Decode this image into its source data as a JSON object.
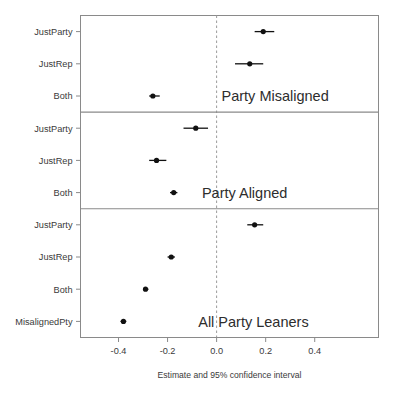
{
  "chart_data": {
    "type": "scatter",
    "title": "",
    "xlabel": "Estimate and 95% confidence interval",
    "ylabel": "",
    "xlim": [
      -0.555,
      0.66
    ],
    "xticks": [
      -0.4,
      -0.2,
      0.0,
      0.2,
      0.4
    ],
    "xticklabels": [
      "-0.4",
      "-0.2",
      "0.0",
      "0.2",
      "0.4"
    ],
    "grid": false,
    "legend": "none",
    "reference_line": 0.0,
    "orientation": "horizontal",
    "panels": [
      {
        "label": "Party Misaligned",
        "label_x": 0.02,
        "rows": [
          {
            "label": "JustParty",
            "estimate": 0.19,
            "ci_low": 0.155,
            "ci_high": 0.235
          },
          {
            "label": "JustRep",
            "estimate": 0.135,
            "ci_low": 0.075,
            "ci_high": 0.19
          },
          {
            "label": "Both",
            "estimate": -0.26,
            "ci_low": -0.275,
            "ci_high": -0.232
          }
        ]
      },
      {
        "label": "Party Aligned",
        "label_x": -0.06,
        "rows": [
          {
            "label": "JustParty",
            "estimate": -0.085,
            "ci_low": -0.135,
            "ci_high": -0.035
          },
          {
            "label": "JustRep",
            "estimate": -0.245,
            "ci_low": -0.275,
            "ci_high": -0.205
          },
          {
            "label": "Both",
            "estimate": -0.175,
            "ci_low": -0.19,
            "ci_high": -0.16
          }
        ]
      },
      {
        "label": "All Party Leaners",
        "label_x": -0.075,
        "rows": [
          {
            "label": "JustParty",
            "estimate": 0.155,
            "ci_low": 0.125,
            "ci_high": 0.19
          },
          {
            "label": "JustRep",
            "estimate": -0.185,
            "ci_low": -0.2,
            "ci_high": -0.17
          },
          {
            "label": "Both",
            "estimate": -0.29,
            "ci_low": -0.3,
            "ci_high": -0.278
          },
          {
            "label": "MisalignedPty",
            "estimate": -0.38,
            "ci_low": -0.392,
            "ci_high": -0.368
          }
        ]
      }
    ]
  },
  "colors": {
    "point": "#111111",
    "frame": "#8a8a8a",
    "zero_line": "#9a9a9a",
    "text": "#3a3a3a"
  }
}
